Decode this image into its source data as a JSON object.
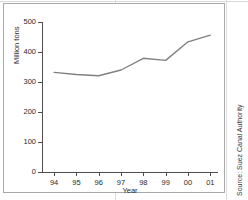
{
  "figure": {
    "source_note": "Source: Suez Canal Authority"
  },
  "chart_data": {
    "type": "line",
    "title": "",
    "xlabel": "Year",
    "ylabel": "Million tons",
    "categories": [
      "94",
      "95",
      "96",
      "97",
      "98",
      "99",
      "00",
      "01"
    ],
    "values": [
      332,
      325,
      321,
      340,
      379,
      372,
      434,
      456
    ],
    "series": [
      {
        "name": "Million tons",
        "values": [
          332,
          325,
          321,
          340,
          379,
          372,
          434,
          456
        ]
      }
    ],
    "yticks": [
      0,
      100,
      200,
      300,
      400,
      500
    ],
    "ylim": [
      0,
      500
    ],
    "xticks": [
      "94",
      "95",
      "96",
      "97",
      "98",
      "99",
      "00",
      "01"
    ],
    "grid": false,
    "legend": "none",
    "line_color": "#808080"
  }
}
